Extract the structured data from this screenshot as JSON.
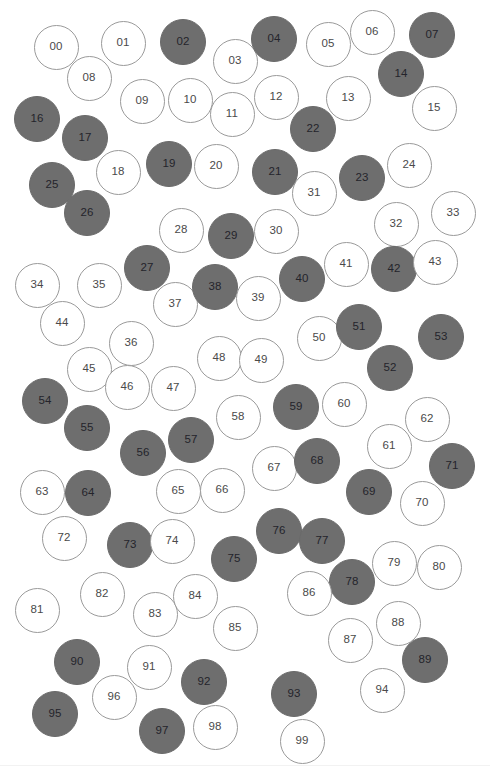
{
  "figure": {
    "width": 490,
    "height": 774,
    "background_color": "#ffffff",
    "open_fill_color": "#ffffff",
    "open_stroke_color": "#9a9a9a",
    "filled_fill_color": "#6e6e6e",
    "filled_stroke_color": "#6a6a6a",
    "open_label_color": "#4a4a4a",
    "filled_label_color": "#24242b",
    "node_count": 100,
    "filled_count": 39,
    "open_count": 61
  },
  "chart_data": {
    "type": "scatter",
    "xlabel": "",
    "ylabel": "",
    "xlim": [
      0,
      490
    ],
    "ylim": [
      0,
      774
    ],
    "grid": false,
    "legend": [
      {
        "name": "filled",
        "color": "#6e6e6e"
      },
      {
        "name": "open",
        "color": "#ffffff"
      }
    ],
    "marker": "circle",
    "marker_diameter": 45,
    "points": [
      {
        "label": "00",
        "x": 56,
        "y": 47,
        "d": 45,
        "state": "open"
      },
      {
        "label": "01",
        "x": 123,
        "y": 43,
        "d": 45,
        "state": "open"
      },
      {
        "label": "02",
        "x": 183,
        "y": 42,
        "d": 46,
        "state": "filled"
      },
      {
        "label": "03",
        "x": 235,
        "y": 61,
        "d": 45,
        "state": "open"
      },
      {
        "label": "04",
        "x": 274,
        "y": 39,
        "d": 46,
        "state": "filled"
      },
      {
        "label": "05",
        "x": 328,
        "y": 44,
        "d": 45,
        "state": "open"
      },
      {
        "label": "06",
        "x": 372,
        "y": 32,
        "d": 45,
        "state": "open"
      },
      {
        "label": "07",
        "x": 432,
        "y": 35,
        "d": 46,
        "state": "filled"
      },
      {
        "label": "08",
        "x": 89,
        "y": 78,
        "d": 45,
        "state": "open"
      },
      {
        "label": "09",
        "x": 142,
        "y": 101,
        "d": 45,
        "state": "open"
      },
      {
        "label": "10",
        "x": 190,
        "y": 100,
        "d": 45,
        "state": "open"
      },
      {
        "label": "11",
        "x": 232,
        "y": 114,
        "d": 45,
        "state": "open"
      },
      {
        "label": "12",
        "x": 276,
        "y": 97,
        "d": 45,
        "state": "open"
      },
      {
        "label": "13",
        "x": 348,
        "y": 98,
        "d": 45,
        "state": "open"
      },
      {
        "label": "14",
        "x": 401,
        "y": 74,
        "d": 46,
        "state": "filled"
      },
      {
        "label": "15",
        "x": 434,
        "y": 108,
        "d": 45,
        "state": "open"
      },
      {
        "label": "16",
        "x": 37,
        "y": 119,
        "d": 46,
        "state": "filled"
      },
      {
        "label": "17",
        "x": 85,
        "y": 138,
        "d": 46,
        "state": "filled"
      },
      {
        "label": "18",
        "x": 118,
        "y": 172,
        "d": 45,
        "state": "open"
      },
      {
        "label": "19",
        "x": 169,
        "y": 164,
        "d": 46,
        "state": "filled"
      },
      {
        "label": "20",
        "x": 216,
        "y": 166,
        "d": 45,
        "state": "open"
      },
      {
        "label": "21",
        "x": 275,
        "y": 172,
        "d": 46,
        "state": "filled"
      },
      {
        "label": "22",
        "x": 313,
        "y": 129,
        "d": 46,
        "state": "filled"
      },
      {
        "label": "23",
        "x": 362,
        "y": 178,
        "d": 46,
        "state": "filled"
      },
      {
        "label": "24",
        "x": 409,
        "y": 165,
        "d": 45,
        "state": "open"
      },
      {
        "label": "25",
        "x": 52,
        "y": 185,
        "d": 46,
        "state": "filled"
      },
      {
        "label": "26",
        "x": 87,
        "y": 213,
        "d": 46,
        "state": "filled"
      },
      {
        "label": "27",
        "x": 147,
        "y": 268,
        "d": 46,
        "state": "filled"
      },
      {
        "label": "28",
        "x": 181,
        "y": 230,
        "d": 45,
        "state": "open"
      },
      {
        "label": "29",
        "x": 231,
        "y": 236,
        "d": 46,
        "state": "filled"
      },
      {
        "label": "30",
        "x": 276,
        "y": 231,
        "d": 45,
        "state": "open"
      },
      {
        "label": "31",
        "x": 314,
        "y": 193,
        "d": 45,
        "state": "open"
      },
      {
        "label": "32",
        "x": 396,
        "y": 224,
        "d": 45,
        "state": "open"
      },
      {
        "label": "33",
        "x": 453,
        "y": 213,
        "d": 45,
        "state": "open"
      },
      {
        "label": "34",
        "x": 37,
        "y": 285,
        "d": 45,
        "state": "open"
      },
      {
        "label": "35",
        "x": 99,
        "y": 285,
        "d": 45,
        "state": "open"
      },
      {
        "label": "36",
        "x": 131,
        "y": 343,
        "d": 45,
        "state": "open"
      },
      {
        "label": "37",
        "x": 175,
        "y": 304,
        "d": 45,
        "state": "open"
      },
      {
        "label": "38",
        "x": 215,
        "y": 287,
        "d": 46,
        "state": "filled"
      },
      {
        "label": "39",
        "x": 258,
        "y": 298,
        "d": 45,
        "state": "open"
      },
      {
        "label": "40",
        "x": 302,
        "y": 279,
        "d": 46,
        "state": "filled"
      },
      {
        "label": "41",
        "x": 346,
        "y": 264,
        "d": 45,
        "state": "open"
      },
      {
        "label": "42",
        "x": 394,
        "y": 269,
        "d": 46,
        "state": "filled"
      },
      {
        "label": "43",
        "x": 435,
        "y": 262,
        "d": 45,
        "state": "open"
      },
      {
        "label": "44",
        "x": 62,
        "y": 323,
        "d": 45,
        "state": "open"
      },
      {
        "label": "45",
        "x": 89,
        "y": 369,
        "d": 45,
        "state": "open"
      },
      {
        "label": "46",
        "x": 127,
        "y": 387,
        "d": 45,
        "state": "open"
      },
      {
        "label": "47",
        "x": 173,
        "y": 388,
        "d": 45,
        "state": "open"
      },
      {
        "label": "48",
        "x": 219,
        "y": 358,
        "d": 45,
        "state": "open"
      },
      {
        "label": "49",
        "x": 261,
        "y": 360,
        "d": 45,
        "state": "open"
      },
      {
        "label": "50",
        "x": 319,
        "y": 338,
        "d": 45,
        "state": "open"
      },
      {
        "label": "51",
        "x": 359,
        "y": 327,
        "d": 46,
        "state": "filled"
      },
      {
        "label": "52",
        "x": 390,
        "y": 368,
        "d": 46,
        "state": "filled"
      },
      {
        "label": "53",
        "x": 441,
        "y": 337,
        "d": 46,
        "state": "filled"
      },
      {
        "label": "54",
        "x": 45,
        "y": 401,
        "d": 46,
        "state": "filled"
      },
      {
        "label": "55",
        "x": 87,
        "y": 428,
        "d": 46,
        "state": "filled"
      },
      {
        "label": "56",
        "x": 143,
        "y": 453,
        "d": 46,
        "state": "filled"
      },
      {
        "label": "57",
        "x": 191,
        "y": 440,
        "d": 46,
        "state": "filled"
      },
      {
        "label": "58",
        "x": 238,
        "y": 417,
        "d": 45,
        "state": "open"
      },
      {
        "label": "59",
        "x": 296,
        "y": 407,
        "d": 46,
        "state": "filled"
      },
      {
        "label": "60",
        "x": 344,
        "y": 404,
        "d": 45,
        "state": "open"
      },
      {
        "label": "61",
        "x": 389,
        "y": 446,
        "d": 45,
        "state": "open"
      },
      {
        "label": "62",
        "x": 427,
        "y": 419,
        "d": 45,
        "state": "open"
      },
      {
        "label": "63",
        "x": 42,
        "y": 492,
        "d": 45,
        "state": "open"
      },
      {
        "label": "64",
        "x": 88,
        "y": 493,
        "d": 46,
        "state": "filled"
      },
      {
        "label": "65",
        "x": 178,
        "y": 491,
        "d": 45,
        "state": "open"
      },
      {
        "label": "66",
        "x": 222,
        "y": 490,
        "d": 45,
        "state": "open"
      },
      {
        "label": "67",
        "x": 274,
        "y": 468,
        "d": 45,
        "state": "open"
      },
      {
        "label": "68",
        "x": 317,
        "y": 461,
        "d": 46,
        "state": "filled"
      },
      {
        "label": "69",
        "x": 369,
        "y": 492,
        "d": 46,
        "state": "filled"
      },
      {
        "label": "70",
        "x": 422,
        "y": 503,
        "d": 45,
        "state": "open"
      },
      {
        "label": "71",
        "x": 452,
        "y": 466,
        "d": 46,
        "state": "filled"
      },
      {
        "label": "72",
        "x": 64,
        "y": 538,
        "d": 45,
        "state": "open"
      },
      {
        "label": "73",
        "x": 130,
        "y": 545,
        "d": 46,
        "state": "filled"
      },
      {
        "label": "74",
        "x": 172,
        "y": 541,
        "d": 45,
        "state": "open"
      },
      {
        "label": "75",
        "x": 234,
        "y": 559,
        "d": 46,
        "state": "filled"
      },
      {
        "label": "76",
        "x": 279,
        "y": 531,
        "d": 46,
        "state": "filled"
      },
      {
        "label": "77",
        "x": 322,
        "y": 541,
        "d": 46,
        "state": "filled"
      },
      {
        "label": "78",
        "x": 352,
        "y": 582,
        "d": 46,
        "state": "filled"
      },
      {
        "label": "79",
        "x": 394,
        "y": 563,
        "d": 45,
        "state": "open"
      },
      {
        "label": "80",
        "x": 439,
        "y": 567,
        "d": 45,
        "state": "open"
      },
      {
        "label": "81",
        "x": 37,
        "y": 610,
        "d": 45,
        "state": "open"
      },
      {
        "label": "82",
        "x": 102,
        "y": 594,
        "d": 45,
        "state": "open"
      },
      {
        "label": "83",
        "x": 155,
        "y": 614,
        "d": 45,
        "state": "open"
      },
      {
        "label": "84",
        "x": 195,
        "y": 596,
        "d": 45,
        "state": "open"
      },
      {
        "label": "85",
        "x": 235,
        "y": 628,
        "d": 45,
        "state": "open"
      },
      {
        "label": "86",
        "x": 309,
        "y": 593,
        "d": 45,
        "state": "open"
      },
      {
        "label": "87",
        "x": 350,
        "y": 640,
        "d": 45,
        "state": "open"
      },
      {
        "label": "88",
        "x": 398,
        "y": 623,
        "d": 45,
        "state": "open"
      },
      {
        "label": "89",
        "x": 425,
        "y": 660,
        "d": 46,
        "state": "filled"
      },
      {
        "label": "90",
        "x": 77,
        "y": 662,
        "d": 46,
        "state": "filled"
      },
      {
        "label": "91",
        "x": 149,
        "y": 667,
        "d": 45,
        "state": "open"
      },
      {
        "label": "92",
        "x": 204,
        "y": 682,
        "d": 46,
        "state": "filled"
      },
      {
        "label": "93",
        "x": 294,
        "y": 694,
        "d": 46,
        "state": "filled"
      },
      {
        "label": "94",
        "x": 382,
        "y": 690,
        "d": 45,
        "state": "open"
      },
      {
        "label": "95",
        "x": 55,
        "y": 714,
        "d": 46,
        "state": "filled"
      },
      {
        "label": "96",
        "x": 114,
        "y": 697,
        "d": 45,
        "state": "open"
      },
      {
        "label": "97",
        "x": 162,
        "y": 731,
        "d": 46,
        "state": "filled"
      },
      {
        "label": "98",
        "x": 215,
        "y": 727,
        "d": 45,
        "state": "open"
      },
      {
        "label": "99",
        "x": 302,
        "y": 741,
        "d": 45,
        "state": "open"
      }
    ]
  }
}
